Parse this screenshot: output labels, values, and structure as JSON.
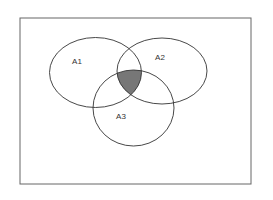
{
  "diagram": {
    "type": "venn",
    "universe": {
      "x": 20,
      "y": 18,
      "width": 231,
      "height": 166
    },
    "sets": [
      {
        "id": "A1",
        "label": "A1",
        "cx": 95.5,
        "cy": 72.5,
        "rx": 46,
        "ry": 35,
        "label_x": 77,
        "label_y": 62
      },
      {
        "id": "A2",
        "label": "A2",
        "cx": 162,
        "cy": 71,
        "rx": 45,
        "ry": 33,
        "label_x": 160,
        "label_y": 58
      },
      {
        "id": "A3",
        "label": "A3",
        "cx": 133.5,
        "cy": 108,
        "rx": 40.5,
        "ry": 38,
        "label_x": 121,
        "label_y": 117
      }
    ],
    "shaded_region": {
      "sets": [
        "A1",
        "A2",
        "A3"
      ],
      "meaning": "A1 ∩ A2 ∩ A3",
      "color": "#777777"
    },
    "colors": {
      "outline": "#333333",
      "frame": "#666666",
      "background": "#ffffff",
      "shade": "#777777"
    }
  }
}
